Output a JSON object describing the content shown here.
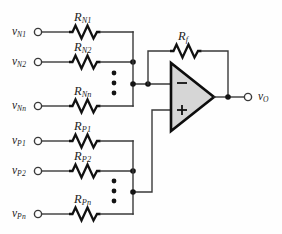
{
  "figure": {
    "background_color": "#fefefe",
    "wire_color": "#3a3a3a",
    "opamp_fill": "#d6d6d6",
    "opamp_stroke": "#0d0d0d"
  },
  "inverting_branch": {
    "group_label": "N",
    "rows": [
      {
        "source": "v",
        "source_sub": "N1",
        "resistor": "R",
        "resistor_sub": "N1"
      },
      {
        "source": "v",
        "source_sub": "N2",
        "resistor": "R",
        "resistor_sub": "N2"
      },
      {
        "source": "v",
        "source_sub": "Nn",
        "resistor": "R",
        "resistor_sub": "Nn"
      }
    ],
    "ellipsis": "vertical-three-dots"
  },
  "noninverting_branch": {
    "group_label": "P",
    "rows": [
      {
        "source": "v",
        "source_sub": "P1",
        "resistor": "R",
        "resistor_sub": "P1"
      },
      {
        "source": "v",
        "source_sub": "P2",
        "resistor": "R",
        "resistor_sub": "P2"
      },
      {
        "source": "v",
        "source_sub": "Pn",
        "resistor": "R",
        "resistor_sub": "Pn"
      }
    ],
    "ellipsis": "vertical-three-dots"
  },
  "feedback": {
    "resistor": "R",
    "resistor_sub": "f"
  },
  "opamp": {
    "minus_sign": "−",
    "plus_sign": "+",
    "inverting_input_name": "inverting-input",
    "noninverting_input_name": "noninverting-input"
  },
  "output": {
    "label": "v",
    "label_sub": "O"
  }
}
